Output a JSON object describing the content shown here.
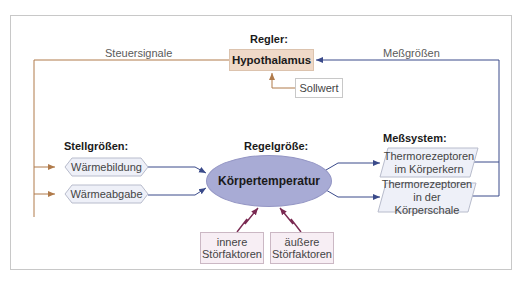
{
  "diagram": {
    "colors": {
      "frame_border": "#c8c8c8",
      "controller_fill": "#efd9c8",
      "controlled_variable_fill": "#a8abd5",
      "actuator_fill": "#eef0f8",
      "sensor_fill": "#eef0f8",
      "disturbance_fill": "#f7eef4",
      "output_arrow_color": "#b07a4a",
      "feedback_arrow_color": "#3a4a8a",
      "disturbance_arrow_color": "#7a2a52"
    },
    "controller": {
      "heading": "Regler:",
      "label": "Hypothalamus"
    },
    "setpoint": {
      "label": "Sollwert"
    },
    "control_signals": {
      "label": "Steuersignale"
    },
    "measured_values": {
      "label": "Meßgrößen"
    },
    "actuators": {
      "heading": "Stellgrößen:",
      "items": [
        {
          "label": "Wärmebildung"
        },
        {
          "label": "Wärmeabgabe"
        }
      ]
    },
    "controlled_variable": {
      "heading": "Regelgröße:",
      "label": "Körpertemperatur"
    },
    "sensors": {
      "heading": "Meßsystem:",
      "items": [
        {
          "line1": "Thermorezeptoren",
          "line2": "im Körperkern"
        },
        {
          "line1": "Thermorezeptoren",
          "line2": "in der Körperschale"
        }
      ]
    },
    "disturbances": {
      "items": [
        {
          "line1": "innere",
          "line2": "Störfaktoren"
        },
        {
          "line1": "äußere",
          "line2": "Störfaktoren"
        }
      ]
    }
  }
}
